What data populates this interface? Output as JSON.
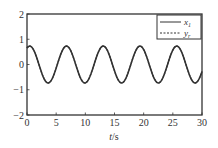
{
  "chart_data": {
    "type": "line",
    "title": "",
    "xlabel": "t/s",
    "ylabel": "",
    "xlim": [
      0,
      30
    ],
    "ylim": [
      -2,
      2
    ],
    "xticks": [
      0,
      5,
      10,
      15,
      20,
      25,
      30
    ],
    "yticks": [
      -2,
      -1,
      0,
      1,
      2
    ],
    "grid": false,
    "legend_position": "upper right",
    "series": [
      {
        "name": "x1",
        "label_main": "x",
        "label_sub": "1",
        "style": "solid",
        "color": "#333333",
        "function": "0.73*sin(2*pi*t/6.3 + 1.1)",
        "amplitude": 0.73,
        "period": 6.3,
        "phase": 1.1
      },
      {
        "name": "yr",
        "label_main": "y",
        "label_sub": "r",
        "style": "dashed",
        "color": "#333333",
        "function": "0.73*sin(2*pi*t/6.3 + 1.1)",
        "amplitude": 0.73,
        "period": 6.3,
        "phase": 1.1
      }
    ]
  }
}
